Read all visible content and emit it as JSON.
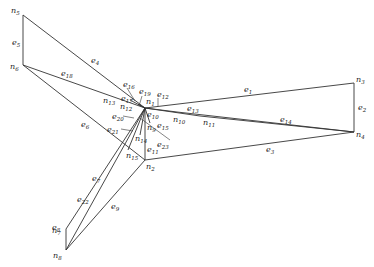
{
  "diagram": {
    "type": "graph",
    "nodes": [
      {
        "id": "n1",
        "base": "n",
        "sub": "1",
        "x": 145,
        "y": 108,
        "lx": 146,
        "ly": 104
      },
      {
        "id": "n2",
        "base": "n",
        "sub": "2",
        "x": 145,
        "y": 160,
        "lx": 146,
        "ly": 169
      },
      {
        "id": "n3",
        "base": "n",
        "sub": "3",
        "x": 354,
        "y": 83,
        "lx": 356,
        "ly": 82
      },
      {
        "id": "n4",
        "base": "n",
        "sub": "4",
        "x": 354,
        "y": 132,
        "lx": 356,
        "ly": 137
      },
      {
        "id": "n5",
        "base": "n",
        "sub": "5",
        "x": 23,
        "y": 15,
        "lx": 11,
        "ly": 13
      },
      {
        "id": "n6",
        "base": "n",
        "sub": "6",
        "x": 23,
        "y": 65,
        "lx": 10,
        "ly": 69
      },
      {
        "id": "n7",
        "base": "n",
        "sub": "7",
        "x": 66,
        "y": 229,
        "lx": 52,
        "ly": 233
      },
      {
        "id": "n8",
        "base": "n",
        "sub": "8",
        "x": 66,
        "y": 250,
        "lx": 53,
        "ly": 258
      },
      {
        "id": "n9",
        "base": "n",
        "sub": "9",
        "x": 150,
        "y": 123,
        "lx": 147,
        "ly": 130
      },
      {
        "id": "n10",
        "base": "n",
        "sub": "10",
        "x": 177,
        "y": 112,
        "lx": 173,
        "ly": 122
      },
      {
        "id": "n11",
        "base": "n",
        "sub": "11",
        "x": 200,
        "y": 116,
        "lx": 203,
        "ly": 125
      },
      {
        "id": "n12",
        "base": "n",
        "sub": "12",
        "x": 138,
        "y": 104,
        "lx": 120,
        "ly": 109
      },
      {
        "id": "n13",
        "base": "n",
        "sub": "13",
        "x": 130,
        "y": 100,
        "lx": 103,
        "ly": 103
      },
      {
        "id": "n14",
        "base": "n",
        "sub": "14",
        "x": 140,
        "y": 135,
        "lx": 135,
        "ly": 141
      },
      {
        "id": "n15",
        "base": "n",
        "sub": "15",
        "x": 128,
        "y": 150,
        "lx": 126,
        "ly": 158
      }
    ],
    "edges": [
      {
        "id": "e1",
        "sub": "1",
        "from": "n1",
        "to": "n3",
        "x1": 145,
        "y1": 108,
        "x2": 354,
        "y2": 83,
        "lx": 244,
        "ly": 92
      },
      {
        "id": "e2",
        "sub": "2",
        "from": "n3",
        "to": "n4",
        "x1": 354,
        "y1": 83,
        "x2": 354,
        "y2": 132,
        "lx": 358,
        "ly": 110
      },
      {
        "id": "e3",
        "sub": "3",
        "from": "n2",
        "to": "n4",
        "x1": 145,
        "y1": 160,
        "x2": 354,
        "y2": 132,
        "lx": 266,
        "ly": 152
      },
      {
        "id": "e4",
        "sub": "4",
        "from": "n5",
        "to": "n1",
        "x1": 23,
        "y1": 15,
        "x2": 145,
        "y2": 108,
        "lx": 91,
        "ly": 63
      },
      {
        "id": "e5",
        "sub": "5",
        "from": "n5",
        "to": "n6",
        "x1": 23,
        "y1": 15,
        "x2": 23,
        "y2": 65,
        "lx": 12,
        "ly": 45
      },
      {
        "id": "e6",
        "sub": "6",
        "from": "n6",
        "to": "n2",
        "x1": 23,
        "y1": 65,
        "x2": 145,
        "y2": 160,
        "lx": 81,
        "ly": 127
      },
      {
        "id": "e7",
        "sub": "7",
        "from": "n7",
        "to": "n1",
        "x1": 66,
        "y1": 229,
        "x2": 145,
        "y2": 108,
        "lx": 92,
        "ly": 181
      },
      {
        "id": "e8",
        "sub": "8",
        "from": "n7",
        "to": "n8",
        "x1": 66,
        "y1": 229,
        "x2": 66,
        "y2": 250,
        "lx": 52,
        "ly": 230
      },
      {
        "id": "e9",
        "sub": "9",
        "from": "n8",
        "to": "n2",
        "x1": 66,
        "y1": 250,
        "x2": 145,
        "y2": 160,
        "lx": 111,
        "ly": 209
      },
      {
        "id": "e10",
        "sub": "10",
        "from": "n1",
        "to": "n10",
        "x1": 145,
        "y1": 108,
        "x2": 177,
        "y2": 112,
        "lx": 147,
        "ly": 117
      },
      {
        "id": "e11",
        "sub": "11",
        "from": "n1",
        "to": "n2",
        "x1": 145,
        "y1": 108,
        "x2": 145,
        "y2": 160,
        "lx": 147,
        "ly": 152
      },
      {
        "id": "e12",
        "sub": "12",
        "from": "",
        "to": "",
        "x1": 158,
        "y1": 98,
        "x2": 158,
        "y2": 106,
        "lx": 157,
        "ly": 97
      },
      {
        "id": "e13",
        "sub": "13",
        "from": "n10",
        "to": "n4",
        "x1": 177,
        "y1": 112,
        "x2": 354,
        "y2": 132,
        "lx": 187,
        "ly": 111
      },
      {
        "id": "e14",
        "sub": "14",
        "from": "n11",
        "to": "n4",
        "x1": 200,
        "y1": 116,
        "x2": 354,
        "y2": 132,
        "lx": 280,
        "ly": 122
      },
      {
        "id": "e15",
        "sub": "15",
        "from": "n1",
        "to": "n9",
        "x1": 145,
        "y1": 108,
        "x2": 150,
        "y2": 123,
        "lx": 157,
        "ly": 128
      },
      {
        "id": "e16",
        "sub": "16",
        "from": "",
        "to": "",
        "x1": 127,
        "y1": 88,
        "x2": 135,
        "y2": 101,
        "lx": 123,
        "ly": 87
      },
      {
        "id": "e17",
        "sub": "17",
        "from": "",
        "to": "",
        "x1": 0,
        "y1": 0,
        "x2": 0,
        "y2": 0,
        "lx": 121,
        "ly": 101
      },
      {
        "id": "e18",
        "sub": "18",
        "from": "n6",
        "to": "n1",
        "x1": 23,
        "y1": 65,
        "x2": 145,
        "y2": 108,
        "lx": 61,
        "ly": 76
      },
      {
        "id": "e19",
        "sub": "19",
        "from": "",
        "to": "",
        "x1": 142,
        "y1": 96,
        "x2": 139,
        "y2": 106,
        "lx": 139,
        "ly": 94
      },
      {
        "id": "e20",
        "sub": "20",
        "from": "",
        "to": "",
        "x1": 123,
        "y1": 116,
        "x2": 134,
        "y2": 118,
        "lx": 112,
        "ly": 119
      },
      {
        "id": "e21",
        "sub": "21",
        "from": "",
        "to": "",
        "x1": 121,
        "y1": 129,
        "x2": 133,
        "y2": 131,
        "lx": 107,
        "ly": 132
      },
      {
        "id": "e22",
        "sub": "22",
        "from": "n8",
        "to": "n1",
        "x1": 66,
        "y1": 250,
        "x2": 145,
        "y2": 108,
        "lx": 77,
        "ly": 202
      },
      {
        "id": "e23",
        "sub": "23",
        "from": "n14",
        "to": "",
        "x1": 140,
        "y1": 118,
        "x2": 170,
        "y2": 140,
        "lx": 157,
        "ly": 147
      }
    ],
    "extra_segments": [
      {
        "x1": 130,
        "y1": 100,
        "x2": 145,
        "y2": 108
      },
      {
        "x1": 138,
        "y1": 104,
        "x2": 145,
        "y2": 108
      },
      {
        "x1": 145,
        "y1": 108,
        "x2": 200,
        "y2": 116
      },
      {
        "x1": 145,
        "y1": 108,
        "x2": 128,
        "y2": 150
      },
      {
        "x1": 145,
        "y1": 108,
        "x2": 140,
        "y2": 135
      }
    ]
  }
}
